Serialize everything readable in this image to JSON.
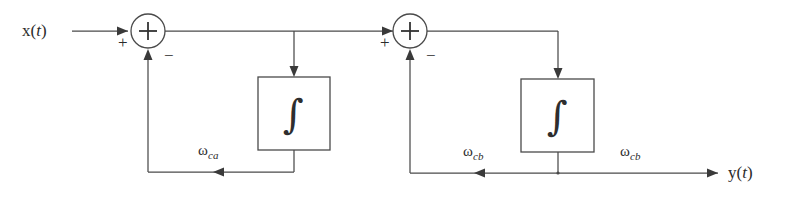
{
  "diagram": {
    "background_color": "#ffffff",
    "line_color": "#4a4a4a",
    "text_color": "#2b2b2b",
    "input": {
      "label_prefix": "x(",
      "label_var": "t",
      "label_suffix": ")"
    },
    "output": {
      "label_prefix": "y(",
      "label_var": "t",
      "label_suffix": ")"
    },
    "summing_junctions": [
      {
        "name": "sum-1",
        "operator": "+",
        "input_sign": "+",
        "feedback_sign": "−"
      },
      {
        "name": "sum-2",
        "operator": "+",
        "input_sign": "+",
        "feedback_sign": "−"
      }
    ],
    "blocks": [
      {
        "name": "integrator-1",
        "symbol": "∫"
      },
      {
        "name": "integrator-2",
        "symbol": "∫"
      }
    ],
    "gain_labels": [
      {
        "name": "gain-omega-ca",
        "symbol": "ω",
        "subscript": "ca"
      },
      {
        "name": "gain-omega-cb-inner",
        "symbol": "ω",
        "subscript": "cb"
      },
      {
        "name": "gain-omega-cb-outer",
        "symbol": "ω",
        "subscript": "cb"
      }
    ]
  }
}
